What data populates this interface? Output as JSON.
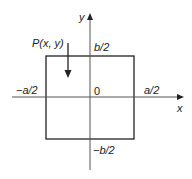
{
  "diagram": {
    "type": "coordinate-rectangle",
    "colors": {
      "stroke": "#222222",
      "axis": "#555555",
      "background": "#ffffff"
    },
    "axes": {
      "x_label": "x",
      "y_label": "y",
      "origin_label": "0"
    },
    "rectangle": {
      "left_label": "−a/2",
      "right_label": "a/2",
      "top_label": "b/2",
      "bottom_label": "−b/2"
    },
    "point": {
      "label": "P(x, y)",
      "arrow_direction": "down"
    }
  }
}
